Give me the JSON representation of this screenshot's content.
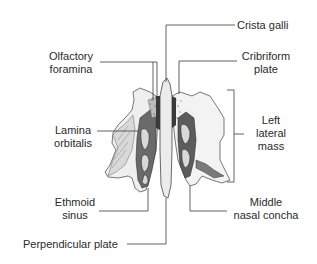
{
  "diagram": {
    "labels": {
      "crista_galli": "Crista galli",
      "cribriform_plate": {
        "line1": "Cribriform",
        "line2": "plate"
      },
      "olfactory_foramina": {
        "line1": "Olfactory",
        "line2": "foramina"
      },
      "left_lateral_mass": {
        "line1": "Left",
        "line2": "lateral",
        "line3": "mass"
      },
      "lamina_orbitalis": {
        "line1": "Lamina",
        "line2": "orbitalis"
      },
      "ethmoid_sinus": {
        "line1": "Ethmoid",
        "line2": "sinus"
      },
      "middle_nasal_concha": {
        "line1": "Middle",
        "line2": "nasal concha"
      },
      "perpendicular_plate": "Perpendicular plate"
    },
    "colors": {
      "line": "#3a3a3a",
      "text": "#2a2a2a",
      "bone_light": "#f2f2f2",
      "bone_shade": "#9a9a9a",
      "bone_dark": "#2b2b2b"
    }
  }
}
